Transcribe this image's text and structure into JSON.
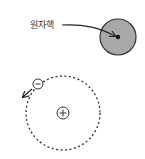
{
  "diagram": {
    "nucleus_label": "원자핵",
    "nucleus_color": "#a8a8a8",
    "electron_symbol": "−",
    "proton_symbol": "+",
    "orbit_style": "dashed"
  }
}
